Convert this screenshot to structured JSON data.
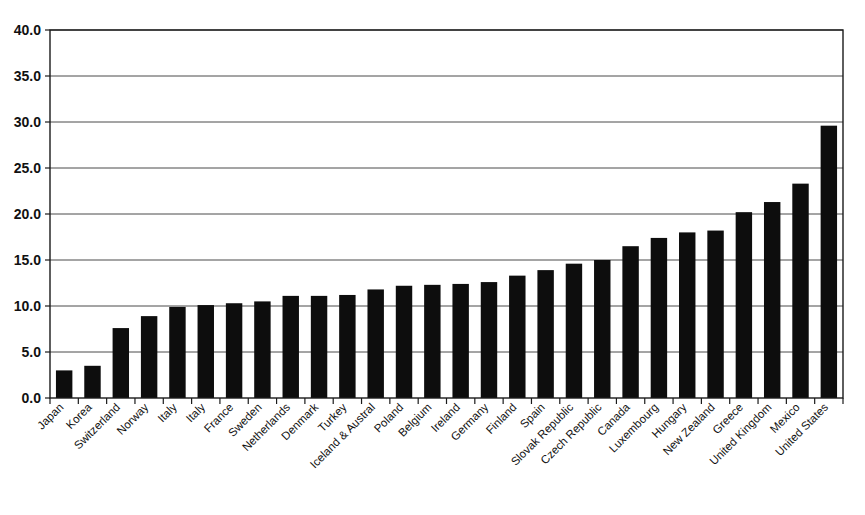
{
  "chart_data": {
    "type": "bar",
    "title": "",
    "subtitle": "",
    "xlabel": "",
    "ylabel": "",
    "ylim": [
      0.0,
      40.0
    ],
    "ytick_step": 5.0,
    "ytick_labels": [
      "0.0",
      "5.0",
      "10.0",
      "15.0",
      "20.0",
      "25.0",
      "30.0",
      "35.0",
      "40.0"
    ],
    "ytick_values": [
      0.0,
      5.0,
      10.0,
      15.0,
      20.0,
      25.0,
      30.0,
      35.0,
      40.0
    ],
    "grid": "horizontal",
    "legend": "none",
    "bar_color": "#0d0d0d",
    "categories": [
      "Japan",
      "Korea",
      "Switzerland",
      "Norway",
      "Italy",
      "Italy",
      "France",
      "Sweden",
      "Netherlands",
      "Denmark",
      "Turkey",
      "Iceland & Austral",
      "Poland",
      "Belgium",
      "Ireland",
      "Germany",
      "Finland",
      "Spain",
      "Slovak Republic",
      "Czech Republic",
      "Canada",
      "Luxembourg",
      "Hungary",
      "New Zealand",
      "Greece",
      "United Kingdom",
      "Mexico",
      "United States"
    ],
    "values": [
      3.0,
      3.5,
      7.6,
      8.9,
      9.9,
      10.1,
      10.3,
      10.5,
      11.1,
      11.1,
      11.2,
      11.8,
      12.2,
      12.3,
      12.4,
      12.6,
      13.3,
      13.9,
      14.6,
      15.0,
      16.5,
      17.4,
      18.0,
      18.2,
      20.2,
      21.3,
      23.3,
      29.6
    ],
    "values_display_note": ""
  },
  "axes": {
    "y_axis_name": "value-axis",
    "x_axis_name": "category-axis"
  }
}
